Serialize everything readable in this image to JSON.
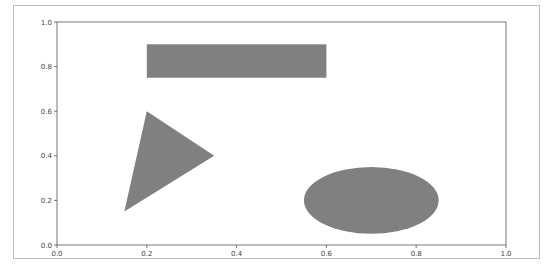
{
  "chart_data": {
    "type": "shapes",
    "title": "",
    "xlabel": "",
    "ylabel": "",
    "xlim": [
      0.0,
      1.0
    ],
    "ylim": [
      0.0,
      1.0
    ],
    "grid": false,
    "x_ticks": [
      "0.0",
      "0.2",
      "0.4",
      "0.6",
      "0.8",
      "1.0"
    ],
    "y_ticks": [
      "0.0",
      "0.2",
      "0.4",
      "0.6",
      "0.8",
      "1.0"
    ],
    "fill_color": "#808080",
    "shapes": [
      {
        "kind": "rectangle",
        "x": 0.2,
        "y": 0.75,
        "width": 0.4,
        "height": 0.15
      },
      {
        "kind": "triangle",
        "points": [
          [
            0.15,
            0.15
          ],
          [
            0.2,
            0.6
          ],
          [
            0.35,
            0.4
          ]
        ]
      },
      {
        "kind": "ellipse",
        "center": [
          0.7,
          0.2
        ],
        "width": 0.3,
        "height": 0.3
      }
    ]
  }
}
